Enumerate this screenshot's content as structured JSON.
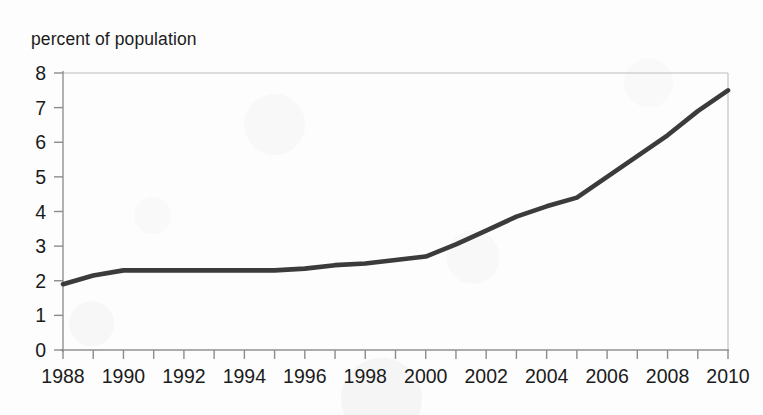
{
  "chart_data": {
    "type": "line",
    "title": "percent of population",
    "subtitle": "",
    "xlabel": "",
    "ylabel": "percent of population",
    "xlim": [
      1988,
      2010
    ],
    "ylim": [
      0,
      8
    ],
    "grid": false,
    "legend": "none",
    "y_ticks": [
      0,
      1,
      2,
      3,
      4,
      5,
      6,
      7,
      8
    ],
    "y_tick_labels": [
      "0",
      "1",
      "2",
      "3",
      "4",
      "5",
      "6",
      "7",
      "8"
    ],
    "x_ticks": [
      1988,
      1989,
      1990,
      1991,
      1992,
      1993,
      1994,
      1995,
      1996,
      1997,
      1998,
      1999,
      2000,
      2001,
      2002,
      2003,
      2004,
      2005,
      2006,
      2007,
      2008,
      2009,
      2010
    ],
    "x_tick_labels": [
      "1988",
      "",
      "1990",
      "",
      "1992",
      "",
      "1994",
      "",
      "1996",
      "",
      "1998",
      "",
      "2000",
      "",
      "2002",
      "",
      "2004",
      "",
      "2006",
      "",
      "2008",
      "",
      "2010"
    ],
    "x_labeled_years": [
      "1988",
      "1990",
      "1992",
      "1994",
      "1996",
      "1998",
      "2000",
      "2002",
      "2004",
      "2006",
      "2008",
      "2010"
    ],
    "series": [
      {
        "name": "percent of population",
        "color": "#3b3b3b",
        "x": [
          1988,
          1989,
          1990,
          1991,
          1992,
          1993,
          1994,
          1995,
          1996,
          1997,
          1998,
          1999,
          2000,
          2001,
          2002,
          2003,
          2004,
          2005,
          2006,
          2007,
          2008,
          2009,
          2010
        ],
        "values": [
          1.9,
          2.15,
          2.3,
          2.3,
          2.3,
          2.3,
          2.3,
          2.3,
          2.35,
          2.45,
          2.5,
          2.6,
          2.7,
          3.05,
          3.45,
          3.85,
          4.15,
          4.4,
          5.0,
          5.6,
          6.2,
          6.9,
          7.5
        ]
      }
    ]
  },
  "colors": {
    "line": "#3b3b3b",
    "axis": "#8c8c8c",
    "frame": "#b9b9b9",
    "text": "#1b1b1b",
    "background": "#fdfdfd"
  }
}
